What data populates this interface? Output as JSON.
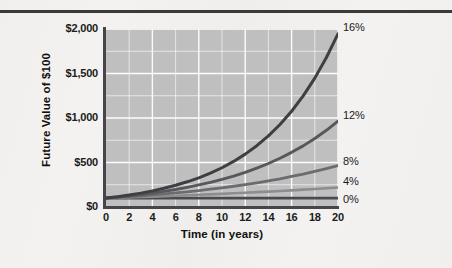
{
  "figure": {
    "has_top_rule": true,
    "background_color": "#f3f2f0",
    "plot_background_color": "#bfbfbf",
    "gridline_color": "#ffffff",
    "axis_color": "#46464a"
  },
  "chart_data": {
    "type": "line",
    "title": "",
    "xlabel": "Time (in years)",
    "ylabel": "Future Value of $100",
    "xlim": [
      0,
      20
    ],
    "ylim": [
      0,
      2000
    ],
    "grid": true,
    "legend_position": "right-end-of-line",
    "x_ticks": [
      "0",
      "2",
      "4",
      "6",
      "8",
      "10",
      "12",
      "14",
      "16",
      "18",
      "20"
    ],
    "x_tick_values": [
      0,
      2,
      4,
      6,
      8,
      10,
      12,
      14,
      16,
      18,
      20
    ],
    "y_ticks": [
      "$0",
      "$500",
      "$1,000",
      "$1,500",
      "$2,000"
    ],
    "y_tick_values": [
      0,
      500,
      1000,
      1500,
      2000
    ],
    "y_minor_gridline_values": [
      250,
      750,
      1250,
      1750
    ],
    "x": [
      0,
      1,
      2,
      3,
      4,
      5,
      6,
      7,
      8,
      9,
      10,
      11,
      12,
      13,
      14,
      15,
      16,
      17,
      18,
      19,
      20
    ],
    "series": [
      {
        "name": "0%",
        "rate_percent": 0,
        "color": "#4a4a4e",
        "width": 2.6,
        "label": "0%",
        "end_value": 100,
        "values": [
          100,
          100,
          100,
          100,
          100,
          100,
          100,
          100,
          100,
          100,
          100,
          100,
          100,
          100,
          100,
          100,
          100,
          100,
          100,
          100,
          100
        ]
      },
      {
        "name": "4%",
        "rate_percent": 4,
        "color": "#8d8d91",
        "width": 2.6,
        "label": "4%",
        "end_value": 219,
        "values": [
          100,
          104,
          108,
          112,
          117,
          122,
          127,
          132,
          137,
          142,
          148,
          154,
          160,
          167,
          173,
          180,
          187,
          195,
          203,
          211,
          219
        ]
      },
      {
        "name": "8%",
        "rate_percent": 8,
        "color": "#6b6b70",
        "width": 2.8,
        "label": "8%",
        "end_value": 466,
        "values": [
          100,
          108,
          117,
          126,
          136,
          147,
          159,
          171,
          185,
          200,
          216,
          233,
          252,
          272,
          294,
          317,
          343,
          370,
          400,
          432,
          466
        ]
      },
      {
        "name": "12%",
        "rate_percent": 12,
        "color": "#58585c",
        "width": 2.9,
        "label": "12%",
        "end_value": 965,
        "values": [
          100,
          112,
          125,
          140,
          157,
          176,
          197,
          221,
          248,
          277,
          311,
          348,
          390,
          437,
          489,
          548,
          614,
          687,
          770,
          862,
          965
        ]
      },
      {
        "name": "16%",
        "rate_percent": 16,
        "color": "#3f3f43",
        "width": 3.0,
        "label": "16%",
        "end_value": 1946,
        "values": [
          100,
          116,
          135,
          156,
          181,
          210,
          244,
          283,
          328,
          380,
          441,
          512,
          594,
          689,
          799,
          927,
          1076,
          1248,
          1448,
          1680,
          1946
        ]
      }
    ]
  }
}
